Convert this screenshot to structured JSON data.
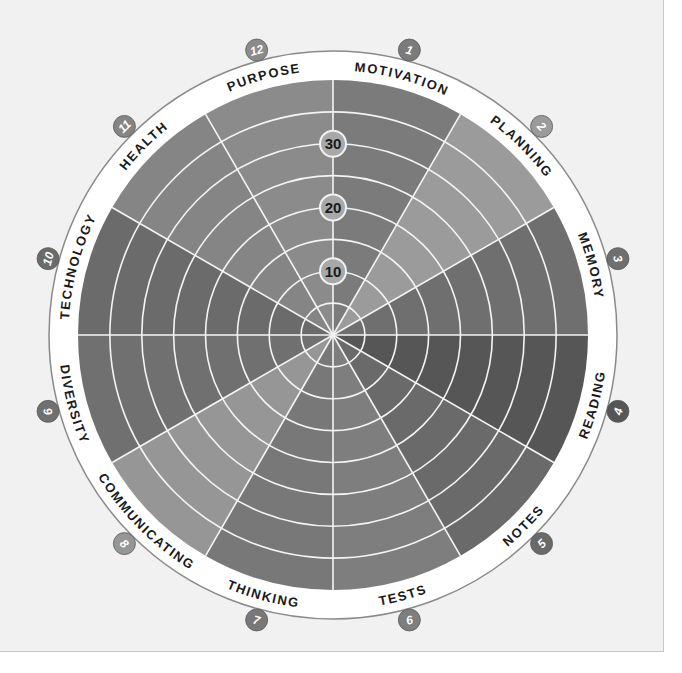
{
  "diagram": {
    "center": [
      333,
      335
    ],
    "wheel_radius": 255,
    "band_outer_radius": 284,
    "badge_radius": 295,
    "ring_count": 8,
    "ring_units_per_step": 5,
    "max_value": 40,
    "scale_labels": [
      {
        "value": 10,
        "text": "10"
      },
      {
        "value": 20,
        "text": "20"
      },
      {
        "value": 30,
        "text": "30"
      }
    ],
    "colors": {
      "panel_bg": "#f1f1f1",
      "band": "#ffffff",
      "band_border": "#8a8a8a",
      "grid_line": "#f4f4f4",
      "label_text": "#1a1a1a",
      "scale_badge_fill": "#a8a8a8"
    },
    "segments": [
      {
        "number": "1",
        "label": "MOTIVATION",
        "color": "#7b7b7b"
      },
      {
        "number": "2",
        "label": "PLANNING",
        "color": "#9b9b9b"
      },
      {
        "number": "3",
        "label": "MEMORY",
        "color": "#6f6f6f"
      },
      {
        "number": "4",
        "label": "READING",
        "color": "#565656"
      },
      {
        "number": "5",
        "label": "NOTES",
        "color": "#6a6a6a"
      },
      {
        "number": "6",
        "label": "TESTS",
        "color": "#7e7e7e"
      },
      {
        "number": "7",
        "label": "THINKING",
        "color": "#787878"
      },
      {
        "number": "8",
        "label": "COMMUNICATING",
        "color": "#969696"
      },
      {
        "number": "9",
        "label": "DIVERSITY",
        "color": "#707070"
      },
      {
        "number": "10",
        "label": "TECHNOLOGY",
        "color": "#6b6b6b"
      },
      {
        "number": "11",
        "label": "HEALTH",
        "color": "#858585"
      },
      {
        "number": "12",
        "label": "PURPOSE",
        "color": "#8b8b8b"
      }
    ]
  }
}
